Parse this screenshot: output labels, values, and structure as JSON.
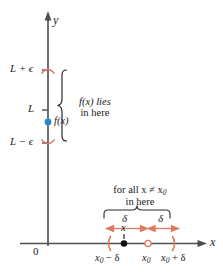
{
  "figure": {
    "colors": {
      "axis": "#4d4d4d",
      "text": "#1a1a1a",
      "accent_salmon": "#e0795f",
      "point_blue": "#2b87c8",
      "brace": "#2b2b2b"
    }
  },
  "axes": {
    "y_label": "y",
    "x_label": "x",
    "origin_label": "0"
  },
  "y_ticks": [
    {
      "id": "l-plus-eps",
      "base": "L",
      "op": "+",
      "sym": "ϵ"
    },
    {
      "id": "l",
      "base": "L",
      "op": "",
      "sym": ""
    },
    {
      "id": "l-minus-eps",
      "base": "L",
      "op": "−",
      "sym": "ϵ"
    }
  ],
  "labels": {
    "l_plus_epsilon": "L + ϵ",
    "l": "L",
    "l_minus_epsilon": "L − ϵ",
    "fx_point": "f(x)"
  },
  "annotations": {
    "range_note_line1": "f(x) lies",
    "range_note_line2": "in here",
    "domain_note_line1_a": "for all ",
    "domain_note_line1_b": "x",
    "domain_note_line1_c": " ≠ ",
    "domain_note_line1_d": "x",
    "domain_note_line1_sub": "0",
    "domain_note_line2": "in here",
    "delta_left": "δ",
    "delta_right": "δ"
  },
  "x_ticks": {
    "x_point": "x",
    "x0_minus_delta_base": "x",
    "x0_minus_delta_sub": "0",
    "x0_minus_delta_tail": " − δ",
    "x0_base": "x",
    "x0_sub": "0",
    "x0_plus_delta_base": "x",
    "x0_plus_delta_sub": "0",
    "x0_plus_delta_tail": " + δ"
  }
}
